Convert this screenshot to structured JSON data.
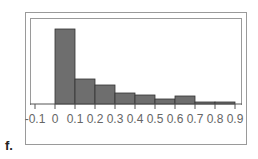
{
  "panel_label": "f.",
  "chart_data": {
    "type": "bar",
    "subtype": "histogram",
    "title": "",
    "xlabel": "",
    "ylabel": "",
    "bins": [
      [
        0,
        0.1
      ],
      [
        0.1,
        0.2
      ],
      [
        0.2,
        0.3
      ],
      [
        0.3,
        0.4
      ],
      [
        0.4,
        0.5
      ],
      [
        0.5,
        0.6
      ],
      [
        0.6,
        0.7
      ],
      [
        0.7,
        0.8
      ],
      [
        0.8,
        0.9
      ]
    ],
    "categories": [
      "0-0.1",
      "0.1-0.2",
      "0.2-0.3",
      "0.3-0.4",
      "0.4-0.5",
      "0.5-0.6",
      "0.6-0.7",
      "0.7-0.8",
      "0.8-0.9"
    ],
    "values": [
      75,
      25,
      19,
      11,
      9,
      5,
      8,
      2,
      2
    ],
    "value_units": "relative frequency (pixel-estimated, no y-axis shown)",
    "x_ticks": [
      "-0.1",
      "0",
      "0.1",
      "0.2",
      "0.3",
      "0.4",
      "0.5",
      "0.6",
      "0.7",
      "0.8",
      "0.9"
    ],
    "xlim": [
      -0.1,
      0.9
    ],
    "grid": false,
    "legend": null,
    "bar_color": "#6e6e6e",
    "bar_edge_color": "#333333"
  }
}
